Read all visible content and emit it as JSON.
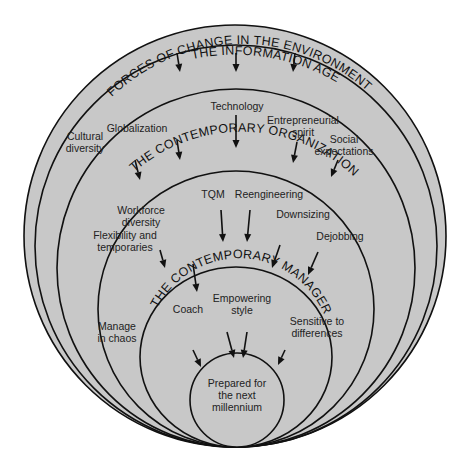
{
  "diagram": {
    "type": "nested-circles",
    "colors": {
      "fill": "#c8c8c8",
      "stroke": "#111111",
      "text": "#222222",
      "background": "#ffffff"
    },
    "layers": [
      {
        "id": "information-age",
        "title": "THE INFORMATION AGE",
        "items": []
      },
      {
        "id": "forces-of-change",
        "title": "FORCES OF CHANGE IN THE ENVIRONMENT",
        "items": [
          [
            "Cultural",
            "diversity"
          ],
          [
            "Globalization"
          ],
          [
            "Technology"
          ],
          [
            "Entrepreneurial",
            "spirit"
          ],
          [
            "Social",
            "expectations"
          ]
        ]
      },
      {
        "id": "contemporary-organization",
        "title": "THE CONTEMPORARY ORGANIZATION",
        "items": [
          [
            "Flexibility and",
            "temporaries"
          ],
          [
            "Workforce",
            "diversity"
          ],
          [
            "TQM"
          ],
          [
            "Reengineering"
          ],
          [
            "Downsizing"
          ],
          [
            "Dejobbing"
          ]
        ]
      },
      {
        "id": "contemporary-manager",
        "title": "THE CONTEMPORARY MANAGER",
        "items": [
          [
            "Manage",
            "in chaos"
          ],
          [
            "Coach"
          ],
          [
            "Empowering",
            "style"
          ],
          [
            "Sensitive to",
            "differences"
          ]
        ]
      },
      {
        "id": "outcome",
        "title": "",
        "items": [
          [
            "Prepared for",
            "the next",
            "millennium"
          ]
        ]
      }
    ]
  }
}
